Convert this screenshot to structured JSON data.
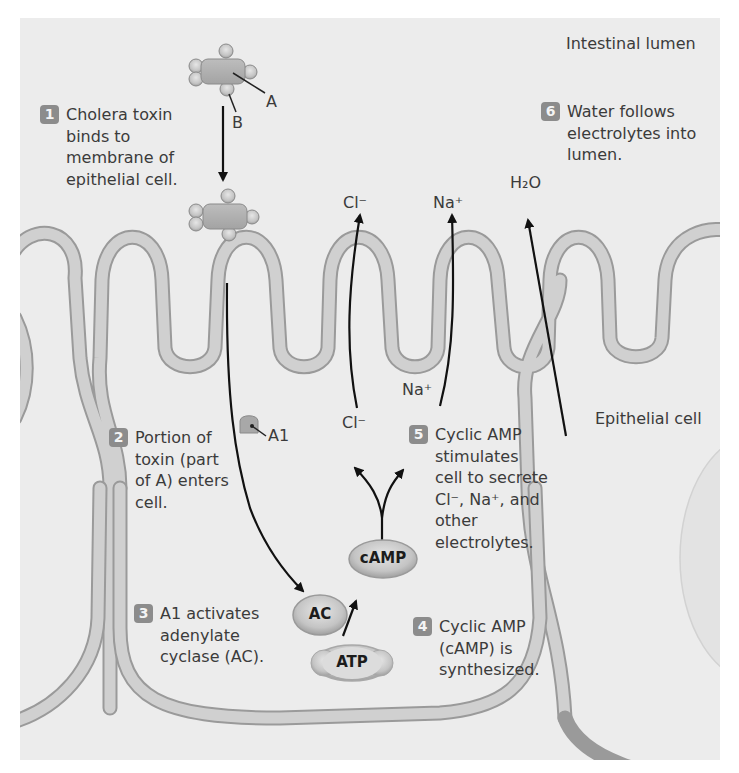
{
  "figure": {
    "region_labels": {
      "lumen": "Intestinal lumen",
      "cell": "Epithelial cell"
    },
    "toxin_labels": {
      "a": "A",
      "b": "B",
      "a1": "A1"
    },
    "ion_labels": {
      "cl_out": "Cl⁻",
      "na_out": "Na⁺",
      "h2o_out": "H₂O",
      "cl_in": "Cl⁻",
      "na_in": "Na⁺"
    },
    "molecules": {
      "ac": "AC",
      "camp": "cAMP",
      "atp": "ATP"
    },
    "steps": [
      {
        "number": "1",
        "text": "Cholera toxin binds to membrane of epithelial cell."
      },
      {
        "number": "2",
        "text": "Portion of toxin (part of A) enters cell."
      },
      {
        "number": "3",
        "text": "A1 activates adenylate cyclase (AC)."
      },
      {
        "number": "4",
        "text": "Cyclic AMP (cAMP) is synthesized."
      },
      {
        "number": "5",
        "text": "Cyclic AMP stimulates cell to secrete Cl⁻, Na⁺, and other electrolytes."
      },
      {
        "number": "6",
        "text": "Water follows electrolytes into lumen."
      }
    ],
    "colors": {
      "background": "#ececec",
      "membrane_fill": "#cfcfcf",
      "membrane_edge": "#9a9a9a",
      "badge": "#8c8c8c",
      "arrow": "#111111"
    }
  }
}
